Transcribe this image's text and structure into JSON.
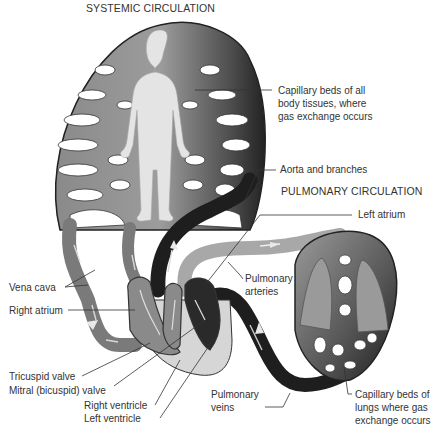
{
  "diagram": {
    "titles": {
      "systemic": "SYSTEMIC CIRCULATION",
      "pulmonary": "PULMONARY CIRCULATION"
    },
    "labels": {
      "capillary_body_1": "Capillary beds of all",
      "capillary_body_2": "body tissues, where",
      "capillary_body_3": "gas exchange occurs",
      "aorta": "Aorta and branches",
      "left_atrium": "Left atrium",
      "pulmonary_arteries_1": "Pulmonary",
      "pulmonary_arteries_2": "arteries",
      "vena_cava": "Vena cava",
      "right_atrium": "Right atrium",
      "tricuspid": "Tricuspid valve",
      "mitral": "Mitral (bicuspid) valve",
      "right_ventricle": "Right ventricle",
      "left_ventricle": "Left ventricle",
      "pulmonary_veins_1": "Pulmonary",
      "pulmonary_veins_2": "veins",
      "capillary_lungs_1": "Capillary beds of",
      "capillary_lungs_2": "lungs where gas",
      "capillary_lungs_3": "exchange occurs"
    },
    "colors": {
      "deoxygenated": "#7a7a7a",
      "oxygenated": "#1e1e1e",
      "pulmonary_artery": "#a8a8a8",
      "body_silhouette": "#e4e4e4",
      "lung": "#9a9a9a",
      "leader_line": "#333333"
    }
  }
}
